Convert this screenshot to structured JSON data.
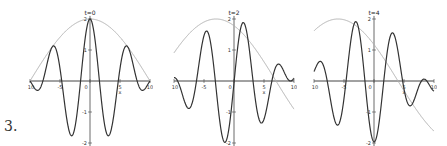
{
  "figure": {
    "label": "3."
  },
  "chart_data": [
    {
      "type": "line",
      "title": "t=0",
      "xlabel": "x",
      "ylabel": "",
      "xlim": [
        -10,
        10
      ],
      "ylim": [
        -2,
        2
      ],
      "x_ticks": [
        "-10",
        "-5",
        "0",
        "5",
        "10"
      ],
      "y_ticks": [
        "2",
        "1",
        "-1",
        "-2"
      ],
      "series": [
        {
          "name": "envelope",
          "color": "#b0b0b0",
          "formula": "2*cos(pi*x/20)"
        },
        {
          "name": "wave",
          "color": "#333333",
          "formula": "2*cos(pi*x/20)*cos(x)"
        }
      ],
      "grid": false
    },
    {
      "type": "line",
      "title": "t=2",
      "xlabel": "x",
      "xlim": [
        -10,
        10
      ],
      "ylim": [
        -2,
        2
      ],
      "x_ticks": [
        "-10",
        "-5",
        "0",
        "5",
        "10"
      ],
      "y_ticks": [
        "2",
        "1",
        "-1",
        "-2"
      ],
      "series": [
        {
          "name": "envelope",
          "color": "#b0b0b0"
        },
        {
          "name": "wave",
          "color": "#333333"
        }
      ],
      "grid": false
    },
    {
      "type": "line",
      "title": "t=4",
      "xlabel": "x",
      "xlim": [
        -10,
        10
      ],
      "ylim": [
        -2,
        2
      ],
      "x_ticks": [
        "-10",
        "-5",
        "0",
        "5",
        "10"
      ],
      "y_ticks": [
        "2",
        "1",
        "-1",
        "-2"
      ],
      "series": [
        {
          "name": "envelope",
          "color": "#b0b0b0"
        },
        {
          "name": "wave",
          "color": "#333333"
        }
      ],
      "grid": false
    }
  ]
}
